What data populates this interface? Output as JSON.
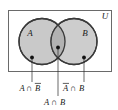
{
  "figure": {
    "type": "venn-diagram",
    "universe_label": "U",
    "sets": [
      {
        "id": "A",
        "label": "A"
      },
      {
        "id": "B",
        "label": "B"
      }
    ],
    "region_labels": [
      {
        "id": "a-not-b",
        "text": "A∩B̅",
        "plain": "A ∩ B-bar",
        "left": "A",
        "op": "∩",
        "right": "B",
        "overline": "right"
      },
      {
        "id": "not-a-b",
        "text": "A̅∩B",
        "plain": "A-bar ∩ B",
        "left": "A",
        "op": "∩",
        "right": "B",
        "overline": "left"
      },
      {
        "id": "a-and-b",
        "text": "A∩B",
        "plain": "A ∩ B",
        "left": "A",
        "op": "∩",
        "right": "B",
        "overline": "none"
      }
    ],
    "colors": {
      "fill": "#c9c9c9",
      "fill_overlap": "#b4b4b4",
      "stroke": "#3a3a3a",
      "frame": "#6a6a6a",
      "text": "#1a1a1a",
      "background": "#ffffff"
    }
  },
  "text": {
    "A": "A",
    "B": "B",
    "U": "U",
    "cap": "∩"
  }
}
